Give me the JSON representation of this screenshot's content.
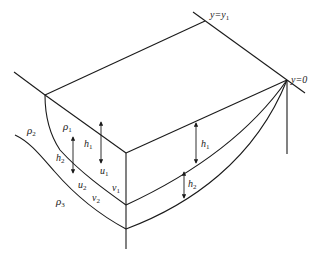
{
  "diagram": {
    "type": "stratified-layer-block-schematic",
    "labels": {
      "y_top": "y=y",
      "y_top_sub": "1",
      "y_zero": "y=0",
      "rho1": "ρ",
      "rho1_sub": "1",
      "rho2": "ρ",
      "rho2_sub": "2",
      "rho3": "ρ",
      "rho3_sub": "3",
      "h1_left": "h",
      "h1_left_sub": "1",
      "h2_left": "h",
      "h2_left_sub": "2",
      "h1_right": "h",
      "h1_right_sub": "1",
      "h2_right": "h",
      "h2_right_sub": "2",
      "u1": "u",
      "u1_sub": "1",
      "u2": "u",
      "u2_sub": "2",
      "v1": "v",
      "v1_sub": "1",
      "v2": "v",
      "v2_sub": "2"
    },
    "colors": {
      "line": "#1a1a1a",
      "text": "#222222",
      "background": "#ffffff"
    }
  }
}
